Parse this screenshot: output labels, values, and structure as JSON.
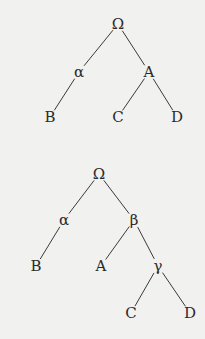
{
  "diagram": {
    "type": "tree-diagrams",
    "background": "#f1f1ef",
    "ink": "#2a2a2a",
    "trees": [
      {
        "name": "tree-1",
        "nodes": [
          {
            "id": "omega",
            "label": "Ω",
            "x": 118,
            "y": 24
          },
          {
            "id": "alpha",
            "label": "α",
            "x": 79,
            "y": 72
          },
          {
            "id": "A",
            "label": "A",
            "x": 149,
            "y": 72
          },
          {
            "id": "B",
            "label": "B",
            "x": 50,
            "y": 117
          },
          {
            "id": "C",
            "label": "C",
            "x": 118,
            "y": 117
          },
          {
            "id": "D",
            "label": "D",
            "x": 177,
            "y": 117
          }
        ],
        "edges": [
          [
            "omega",
            "alpha"
          ],
          [
            "omega",
            "A"
          ],
          [
            "alpha",
            "B"
          ],
          [
            "A",
            "C"
          ],
          [
            "A",
            "D"
          ]
        ]
      },
      {
        "name": "tree-2",
        "nodes": [
          {
            "id": "omega",
            "label": "Ω",
            "x": 99,
            "y": 174
          },
          {
            "id": "alpha",
            "label": "α",
            "x": 64,
            "y": 220
          },
          {
            "id": "beta",
            "label": "β",
            "x": 134,
            "y": 220
          },
          {
            "id": "B",
            "label": "B",
            "x": 36,
            "y": 266
          },
          {
            "id": "A",
            "label": "A",
            "x": 101,
            "y": 266
          },
          {
            "id": "gamma",
            "label": "γ",
            "x": 158,
            "y": 266
          },
          {
            "id": "C",
            "label": "C",
            "x": 131,
            "y": 313
          },
          {
            "id": "D",
            "label": "D",
            "x": 190,
            "y": 313
          }
        ],
        "edges": [
          [
            "omega",
            "alpha"
          ],
          [
            "omega",
            "beta"
          ],
          [
            "alpha",
            "B"
          ],
          [
            "beta",
            "A"
          ],
          [
            "beta",
            "gamma"
          ],
          [
            "gamma",
            "C"
          ],
          [
            "gamma",
            "D"
          ]
        ]
      }
    ]
  }
}
